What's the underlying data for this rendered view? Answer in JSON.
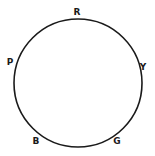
{
  "diagram": {
    "type": "circle-with-labels",
    "circle": {
      "cx": 78,
      "cy": 83,
      "r": 64,
      "stroke": "#1a1a1a",
      "stroke_width": 1.6
    },
    "labels": [
      {
        "text": "R",
        "x": 77,
        "y": 12
      },
      {
        "text": "Y",
        "x": 143,
        "y": 67
      },
      {
        "text": "G",
        "x": 117,
        "y": 141
      },
      {
        "text": "B",
        "x": 36,
        "y": 141
      },
      {
        "text": "P",
        "x": 10,
        "y": 62
      }
    ]
  }
}
